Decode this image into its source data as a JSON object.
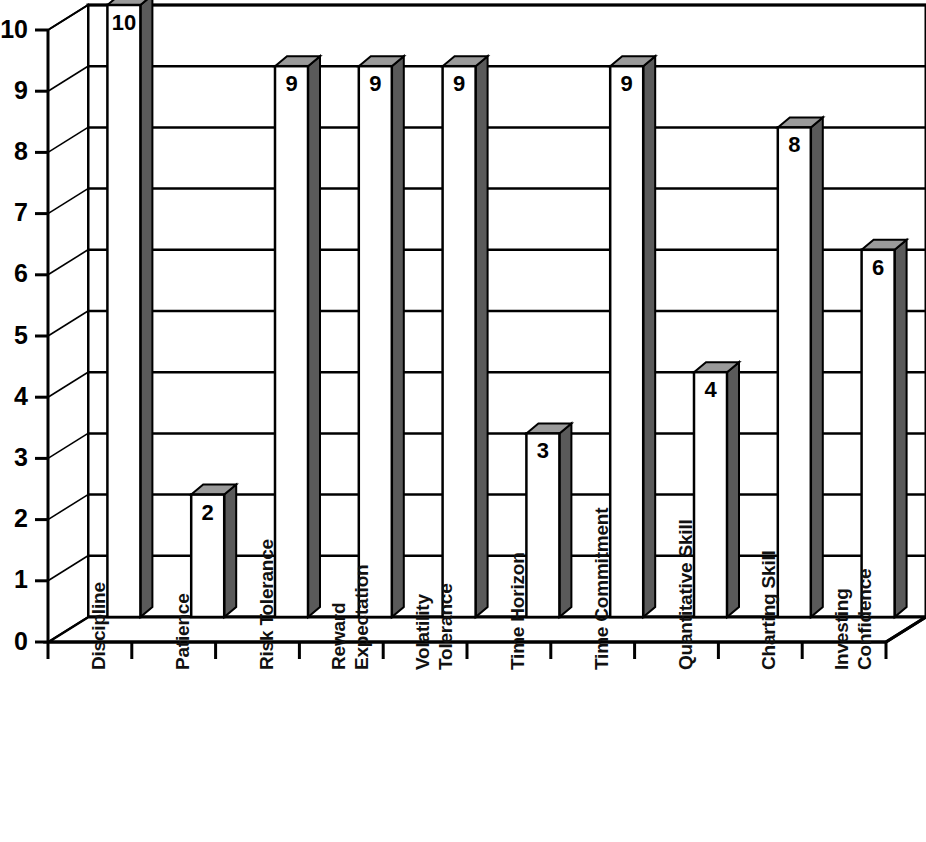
{
  "chart_data": {
    "type": "bar",
    "title": "",
    "subtitle": "",
    "xlabel": "",
    "ylabel": "",
    "ylim": [
      0,
      10
    ],
    "y_ticks": [
      "0",
      "1",
      "2",
      "3",
      "4",
      "5",
      "6",
      "7",
      "8",
      "9",
      "10"
    ],
    "grid": true,
    "legend": "none",
    "style": "3d-column",
    "categories": [
      "Discipline",
      "Patience",
      "Risk Tolerance",
      "Reward Expectation",
      "Volatility Tolerance",
      "Time Horizon",
      "Time Commitment",
      "Quantitative Skill",
      "Charting Skill",
      "Investing Confidence"
    ],
    "category_lines": [
      [
        "Discipline"
      ],
      [
        "Patience"
      ],
      [
        "Risk Tolerance"
      ],
      [
        "Reward",
        "Expectation"
      ],
      [
        "Volatility",
        "Tolerance"
      ],
      [
        "Time Horizon"
      ],
      [
        "Time Commitment"
      ],
      [
        "Quantitative Skill"
      ],
      [
        "Charting Skill"
      ],
      [
        "Investing",
        "Confidence"
      ]
    ],
    "values": [
      10,
      2,
      9,
      9,
      9,
      3,
      9,
      4,
      8,
      6
    ],
    "data_labels": [
      "10",
      "2",
      "9",
      "9",
      "9",
      "3",
      "9",
      "4",
      "8",
      "6"
    ],
    "colors": {
      "bar_front": "#ffffff",
      "bar_side": "#5a5a5a",
      "bar_top": "#9a9a9a",
      "outline": "#000000",
      "plot_background": "#ffffff",
      "gridline": "#000000",
      "axis": "#000000",
      "text": "#000000"
    }
  }
}
